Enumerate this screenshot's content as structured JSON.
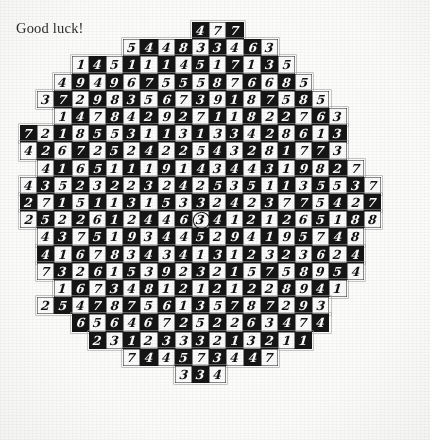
{
  "caption": "Good luck!",
  "puzzle": {
    "shape": "circular-checkerboard-digit-grid",
    "cell_size_px": 17.2,
    "columns": 23,
    "rows_count": 22,
    "colors": {
      "dark_cell": "#151515",
      "light_cell": "#fbfbfb",
      "dark_text": "#fdfdfd",
      "light_text": "#101010",
      "paper": "#fdfdfc",
      "caption_text": "#2b2b2b"
    },
    "marked_cell": {
      "row": 11,
      "col": 10,
      "value": "3"
    },
    "rows": [
      {
        "offset": 10,
        "digits": [
          "4",
          "7",
          "7"
        ]
      },
      {
        "offset": 6,
        "digits": [
          "5",
          "4",
          "4",
          "8",
          "3",
          "3",
          "4",
          "6",
          "3"
        ]
      },
      {
        "offset": 3,
        "digits": [
          "1",
          "4",
          "5",
          "1",
          "1",
          "1",
          "4",
          "5",
          "1",
          "7",
          "1",
          "3",
          "5"
        ]
      },
      {
        "offset": 2,
        "digits": [
          "4",
          "9",
          "4",
          "9",
          "6",
          "7",
          "5",
          "5",
          "5",
          "8",
          "7",
          "6",
          "6",
          "8",
          "5"
        ]
      },
      {
        "offset": 1,
        "digits": [
          "3",
          "7",
          "2",
          "9",
          "8",
          "3",
          "5",
          "6",
          "7",
          "3",
          "9",
          "1",
          "8",
          "7",
          "5",
          "8",
          "5"
        ]
      },
      {
        "offset": 2,
        "digits": [
          "1",
          "4",
          "7",
          "8",
          "4",
          "2",
          "9",
          "2",
          "7",
          "1",
          "1",
          "8",
          "2",
          "2",
          "7",
          "6",
          "3"
        ]
      },
      {
        "offset": 0,
        "digits": [
          "7",
          "2",
          "1",
          "8",
          "5",
          "5",
          "3",
          "1",
          "1",
          "3",
          "1",
          "3",
          "3",
          "4",
          "2",
          "8",
          "6",
          "1",
          "3"
        ]
      },
      {
        "offset": 0,
        "digits": [
          "4",
          "2",
          "6",
          "7",
          "2",
          "5",
          "2",
          "4",
          "2",
          "2",
          "5",
          "4",
          "3",
          "2",
          "8",
          "1",
          "7",
          "7",
          "3"
        ]
      },
      {
        "offset": 1,
        "digits": [
          "4",
          "1",
          "6",
          "5",
          "1",
          "1",
          "1",
          "9",
          "1",
          "4",
          "3",
          "4",
          "4",
          "3",
          "1",
          "9",
          "8",
          "2",
          "7"
        ]
      },
      {
        "offset": 0,
        "digits": [
          "4",
          "3",
          "5",
          "2",
          "3",
          "2",
          "2",
          "3",
          "2",
          "4",
          "2",
          "5",
          "3",
          "5",
          "1",
          "1",
          "3",
          "5",
          "5",
          "3",
          "7"
        ]
      },
      {
        "offset": 0,
        "digits": [
          "2",
          "7",
          "1",
          "5",
          "1",
          "1",
          "3",
          "1",
          "5",
          "3",
          "3",
          "2",
          "4",
          "2",
          "3",
          "7",
          "7",
          "5",
          "4",
          "2",
          "7"
        ]
      },
      {
        "offset": 0,
        "digits": [
          "2",
          "5",
          "2",
          "2",
          "6",
          "1",
          "2",
          "4",
          "4",
          "6",
          "3",
          "4",
          "1",
          "2",
          "1",
          "2",
          "6",
          "5",
          "1",
          "8",
          "8"
        ]
      },
      {
        "offset": 1,
        "digits": [
          "4",
          "3",
          "7",
          "5",
          "1",
          "9",
          "3",
          "4",
          "4",
          "5",
          "2",
          "9",
          "4",
          "1",
          "9",
          "5",
          "7",
          "4",
          "8"
        ]
      },
      {
        "offset": 1,
        "digits": [
          "4",
          "1",
          "6",
          "7",
          "8",
          "3",
          "4",
          "3",
          "4",
          "1",
          "3",
          "1",
          "2",
          "3",
          "2",
          "3",
          "6",
          "2",
          "4"
        ]
      },
      {
        "offset": 1,
        "digits": [
          "7",
          "3",
          "2",
          "6",
          "1",
          "5",
          "3",
          "9",
          "2",
          "3",
          "2",
          "1",
          "5",
          "7",
          "5",
          "8",
          "9",
          "5",
          "4"
        ]
      },
      {
        "offset": 2,
        "digits": [
          "1",
          "6",
          "7",
          "3",
          "4",
          "8",
          "1",
          "2",
          "1",
          "2",
          "1",
          "2",
          "2",
          "8",
          "9",
          "4",
          "1"
        ]
      },
      {
        "offset": 1,
        "digits": [
          "2",
          "5",
          "4",
          "7",
          "8",
          "7",
          "5",
          "6",
          "1",
          "3",
          "5",
          "7",
          "8",
          "7",
          "2",
          "9",
          "3"
        ]
      },
      {
        "offset": 3,
        "digits": [
          "6",
          "5",
          "6",
          "4",
          "6",
          "7",
          "2",
          "5",
          "2",
          "2",
          "6",
          "3",
          "4",
          "7",
          "4"
        ]
      },
      {
        "offset": 4,
        "digits": [
          "2",
          "3",
          "1",
          "2",
          "3",
          "3",
          "3",
          "2",
          "1",
          "3",
          "2",
          "1",
          "1"
        ]
      },
      {
        "offset": 6,
        "digits": [
          "7",
          "4",
          "4",
          "5",
          "7",
          "3",
          "4",
          "4",
          "7"
        ]
      },
      {
        "offset": 9,
        "digits": [
          "3",
          "3",
          "4"
        ]
      }
    ]
  }
}
